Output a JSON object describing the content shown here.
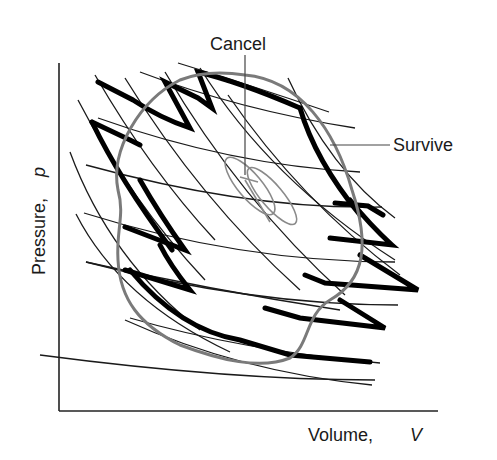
{
  "figure": {
    "type": "pV diagram",
    "x_axis_label": "Volume,",
    "x_axis_symbol": "V",
    "y_axis_label": "Pressure,",
    "y_axis_symbol": "p",
    "annotations": {
      "cancel": "Cancel",
      "survive": "Survive"
    },
    "colors": {
      "thin_lines": "#1a1a1a",
      "boundary_zigzag": "#000000",
      "cycle_loop": "#7a7a7a",
      "background": "#ffffff"
    }
  }
}
